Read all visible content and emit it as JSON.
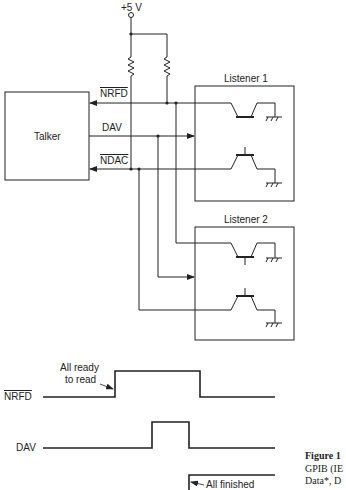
{
  "circuit": {
    "supply_label": "+5 V",
    "talker_label": "Talker",
    "listeners": [
      {
        "label": "Listener 1"
      },
      {
        "label": "Listener 2"
      }
    ],
    "signals": [
      {
        "name": "NRFD",
        "active_low": true,
        "direction": "to-talker"
      },
      {
        "name": "DAV",
        "active_low": false,
        "direction": "to-listeners"
      },
      {
        "name": "NDAC",
        "active_low": true,
        "direction": "to-talker"
      }
    ]
  },
  "timing": {
    "rows": [
      {
        "label": "NRFD",
        "active_low": true,
        "annotation": "All ready to read",
        "annotation_line1": "All ready",
        "annotation_line2": "to read"
      },
      {
        "label": "DAV",
        "active_low": false
      },
      {
        "label": "NDAC",
        "active_low": true,
        "annotation": "All finished"
      }
    ]
  },
  "caption": {
    "title": "Figure 1",
    "line2": "GPIB (IE",
    "line3": "Data*, D"
  },
  "colors": {
    "ink": "#222222",
    "background": "#ffffff"
  }
}
